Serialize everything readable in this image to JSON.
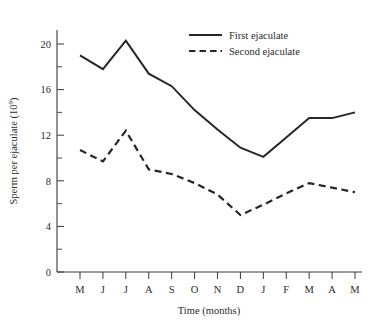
{
  "chart_data": {
    "type": "line",
    "title": "",
    "xlabel": "Time (months)",
    "ylabel": "Sperm per ejaculate (10",
    "ylabel_exponent": "9",
    "ylabel_close": ")",
    "categories": [
      "M",
      "J",
      "J",
      "A",
      "S",
      "O",
      "N",
      "D",
      "J",
      "F",
      "M",
      "A",
      "M"
    ],
    "ylim": [
      0,
      22
    ],
    "yticks": [
      0,
      4,
      8,
      12,
      16,
      20
    ],
    "yticks_minor": [
      2,
      6,
      10,
      14,
      18
    ],
    "grid": false,
    "legend_position": "top-right",
    "series": [
      {
        "name": "First ejaculate",
        "style": "solid",
        "color": "#262626",
        "values": [
          19.0,
          17.8,
          20.3,
          17.4,
          16.3,
          14.2,
          12.5,
          10.9,
          10.1,
          11.8,
          13.5,
          13.5,
          14.0
        ]
      },
      {
        "name": "Second ejaculate",
        "style": "dashed",
        "color": "#262626",
        "values": [
          10.7,
          9.7,
          12.4,
          9.0,
          8.6,
          7.8,
          6.8,
          5.0,
          5.9,
          6.9,
          7.8,
          7.4,
          7.0
        ]
      }
    ]
  },
  "legend": {
    "items": [
      {
        "label": "First ejaculate"
      },
      {
        "label": "Second ejaculate"
      }
    ]
  },
  "axes": {
    "x_title": "Time (months)",
    "y_title_main": "Sperm per ejaculate (10",
    "y_title_sup": "9",
    "y_title_end": ")"
  }
}
